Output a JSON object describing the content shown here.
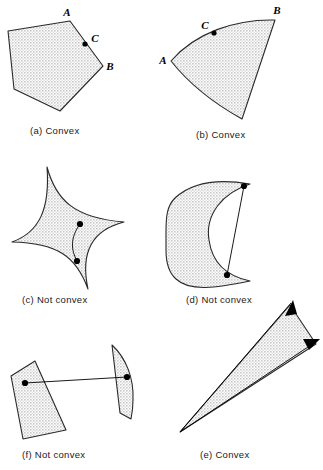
{
  "figure": {
    "background_color": "#ffffff",
    "fill_color": "#d9d9d9",
    "stroke_color": "#2a2a2a",
    "panels": [
      {
        "id": "a",
        "caption": "(a)  Convex",
        "caption_x": 30,
        "caption_y": 134,
        "shape": "pentagon",
        "point_labels": [
          {
            "text": "A",
            "x": 67,
            "y": 16
          },
          {
            "text": "C",
            "x": 95,
            "y": 42
          },
          {
            "text": "B",
            "x": 110,
            "y": 70
          }
        ]
      },
      {
        "id": "b",
        "caption": "(b)  Convex",
        "caption_x": 196,
        "caption_y": 138,
        "shape": "circular-sector",
        "point_labels": [
          {
            "text": "C",
            "x": 205,
            "y": 29
          },
          {
            "text": "B",
            "x": 277,
            "y": 14
          },
          {
            "text": "A",
            "x": 163,
            "y": 64
          }
        ]
      },
      {
        "id": "c",
        "caption": "(c)  Not convex",
        "caption_x": 22,
        "caption_y": 303,
        "shape": "astroid-star",
        "point_labels": []
      },
      {
        "id": "d",
        "caption": "(d)  Not convex",
        "caption_x": 186,
        "caption_y": 303,
        "shape": "crescent",
        "point_labels": []
      },
      {
        "id": "f",
        "caption": "(f)  Not convex",
        "caption_x": 22,
        "caption_y": 458,
        "shape": "two-disjoint-pieces",
        "point_labels": []
      },
      {
        "id": "e",
        "caption": "(e)  Convex",
        "caption_x": 200,
        "caption_y": 458,
        "shape": "infinite-cone",
        "point_labels": []
      }
    ]
  }
}
